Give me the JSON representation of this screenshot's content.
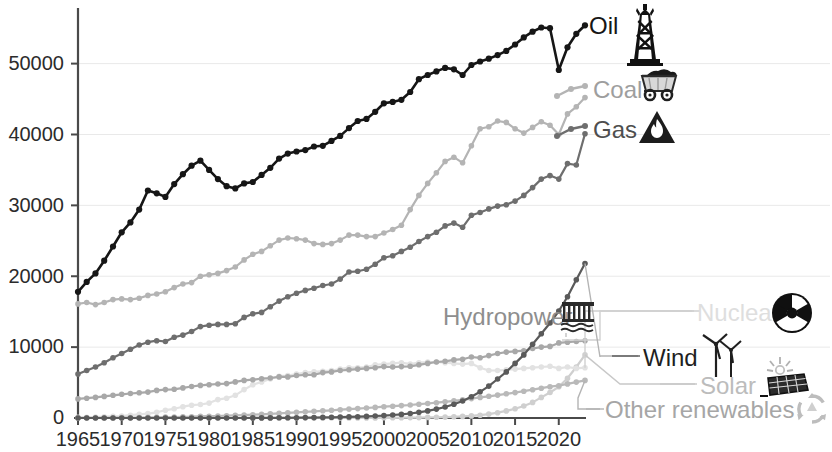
{
  "chart_data": {
    "type": "line",
    "title": "",
    "subtitle": "",
    "xlabel": "",
    "ylabel": "",
    "xlim": [
      1965,
      2023
    ],
    "ylim": [
      0,
      57000
    ],
    "grid": true,
    "legend_position": "inline-right-labels",
    "x_ticks": [
      "1965",
      "1970",
      "1975",
      "1980",
      "1985",
      "1990",
      "1995",
      "2000",
      "2005",
      "2010",
      "2015",
      "2020"
    ],
    "x_tick_values": [
      1965,
      1970,
      1975,
      1980,
      1985,
      1990,
      1995,
      2000,
      2005,
      2010,
      2015,
      2020
    ],
    "y_ticks": [
      "0",
      "10000",
      "20000",
      "30000",
      "40000",
      "50000"
    ],
    "y_tick_values": [
      0,
      10000,
      20000,
      30000,
      40000,
      50000
    ],
    "x": [
      1965,
      1966,
      1967,
      1968,
      1969,
      1970,
      1971,
      1972,
      1973,
      1974,
      1975,
      1976,
      1977,
      1978,
      1979,
      1980,
      1981,
      1982,
      1983,
      1984,
      1985,
      1986,
      1987,
      1988,
      1989,
      1990,
      1991,
      1992,
      1993,
      1994,
      1995,
      1996,
      1997,
      1998,
      1999,
      2000,
      2001,
      2002,
      2003,
      2004,
      2005,
      2006,
      2007,
      2008,
      2009,
      2010,
      2011,
      2012,
      2013,
      2014,
      2015,
      2016,
      2017,
      2018,
      2019,
      2020,
      2021,
      2022,
      2023
    ],
    "series": [
      {
        "name": "Oil",
        "color": "#161616",
        "icon": "oil-derrick-icon",
        "label_color": "#161616",
        "values": [
          17800,
          19200,
          20400,
          22200,
          24200,
          26200,
          27600,
          29400,
          32100,
          31700,
          31200,
          33000,
          34400,
          35600,
          36300,
          35000,
          33700,
          32700,
          32400,
          33100,
          33300,
          34300,
          35300,
          36600,
          37300,
          37600,
          37800,
          38300,
          38400,
          39100,
          39800,
          40900,
          41900,
          42200,
          43200,
          44400,
          44600,
          44900,
          46000,
          47800,
          48400,
          48900,
          49400,
          49200,
          48400,
          49800,
          50300,
          50700,
          51200,
          51800,
          52700,
          53700,
          54500,
          55100,
          55000,
          49100,
          52300,
          54200,
          55400
        ]
      },
      {
        "name": "Coal",
        "color": "#b4b4b4",
        "icon": "coal-cart-icon",
        "label_color": "#9e9e9e",
        "values": [
          16100,
          16300,
          16000,
          16300,
          16700,
          16800,
          16700,
          16900,
          17300,
          17500,
          17800,
          18400,
          18900,
          19100,
          20000,
          20200,
          20400,
          20800,
          21300,
          22300,
          23100,
          23500,
          24300,
          25100,
          25400,
          25300,
          25100,
          24600,
          24500,
          24600,
          25100,
          25800,
          25800,
          25600,
          25600,
          26100,
          26600,
          27200,
          29400,
          31400,
          33100,
          34600,
          36200,
          36800,
          36000,
          38400,
          40800,
          41100,
          41900,
          41700,
          40800,
          40200,
          41000,
          41800,
          41300,
          40000,
          42900,
          43900,
          45200
        ]
      },
      {
        "name": "Gas",
        "color": "#6e6e6e",
        "icon": "gas-flame-icon",
        "label_color": "#4e4e4e",
        "values": [
          6200,
          6700,
          7200,
          7800,
          8500,
          9100,
          9700,
          10300,
          10700,
          10900,
          10800,
          11400,
          11700,
          12200,
          12900,
          13100,
          13200,
          13200,
          13300,
          14200,
          14700,
          14900,
          15700,
          16500,
          17100,
          17600,
          18000,
          18300,
          18700,
          18900,
          19600,
          20600,
          20700,
          21000,
          21700,
          22600,
          22900,
          23500,
          24100,
          24900,
          25600,
          26200,
          27100,
          27500,
          26900,
          28600,
          29000,
          29500,
          29900,
          30100,
          30600,
          31400,
          32500,
          33700,
          34200,
          33700,
          35900,
          35700,
          40100
        ]
      },
      {
        "name": "Hydropower",
        "color": "#a8a8a8",
        "icon": "hydro-dam-icon",
        "label_color": "#8e8e8e",
        "values": [
          2700,
          2800,
          2900,
          3050,
          3200,
          3350,
          3450,
          3550,
          3650,
          3900,
          4000,
          4050,
          4250,
          4450,
          4600,
          4700,
          4800,
          4850,
          5100,
          5300,
          5400,
          5550,
          5650,
          5800,
          5800,
          6000,
          6100,
          6100,
          6400,
          6500,
          6700,
          6800,
          6900,
          7000,
          7100,
          7250,
          7200,
          7250,
          7300,
          7500,
          7700,
          7900,
          8000,
          8200,
          8300,
          8600,
          8500,
          8800,
          9100,
          9300,
          9400,
          9500,
          9800,
          10000,
          10100,
          10600,
          10700,
          10800,
          10900
        ]
      },
      {
        "name": "Nuclear",
        "color": "#e2e2e2",
        "icon": "nuclear-radiation-icon",
        "label_color": "#dcdcdc",
        "values": [
          80,
          100,
          130,
          180,
          230,
          280,
          390,
          510,
          620,
          800,
          1100,
          1300,
          1600,
          1800,
          1900,
          2100,
          2600,
          2800,
          3200,
          4000,
          4700,
          5100,
          5500,
          5900,
          6000,
          6200,
          6400,
          6500,
          6600,
          6700,
          6900,
          7100,
          7100,
          7200,
          7500,
          7600,
          7700,
          7800,
          7600,
          7800,
          7900,
          7900,
          7800,
          7700,
          7600,
          7700,
          7100,
          6700,
          6700,
          6800,
          6900,
          7000,
          7100,
          7200,
          7300,
          7000,
          7200,
          7000,
          7100
        ]
      },
      {
        "name": "Wind",
        "color": "#5a5a5a",
        "icon": "wind-turbine-icon",
        "label_color": "#1f1f1f",
        "values": [
          0,
          0,
          0,
          0,
          0,
          0,
          0,
          0,
          0,
          0,
          0,
          0,
          0,
          0,
          0,
          0,
          0,
          0,
          0,
          0,
          10,
          15,
          20,
          25,
          30,
          40,
          50,
          60,
          80,
          100,
          120,
          150,
          180,
          220,
          280,
          340,
          420,
          510,
          640,
          800,
          1000,
          1250,
          1550,
          1950,
          2400,
          3000,
          3700,
          4500,
          5500,
          6500,
          7700,
          8900,
          10400,
          11900,
          13400,
          15100,
          17100,
          19500,
          21800
        ]
      },
      {
        "name": "Solar",
        "color": "#cfcfcf",
        "icon": "solar-panel-icon",
        "label_color": "#b8b8b8",
        "values": [
          0,
          0,
          0,
          0,
          0,
          0,
          0,
          0,
          0,
          0,
          0,
          0,
          0,
          0,
          0,
          0,
          0,
          0,
          0,
          0,
          0,
          0,
          0,
          0,
          0,
          2,
          3,
          4,
          5,
          7,
          9,
          11,
          14,
          17,
          21,
          26,
          32,
          40,
          50,
          63,
          80,
          100,
          130,
          170,
          220,
          290,
          400,
          550,
          750,
          1000,
          1300,
          1700,
          2200,
          2900,
          3600,
          4400,
          5600,
          7200,
          8900
        ]
      },
      {
        "name": "Other renewables",
        "color": "#b9b9b9",
        "icon": "recycle-leaf-icon",
        "label_color": "#a0a0a0",
        "values": [
          20,
          25,
          30,
          35,
          40,
          50,
          60,
          70,
          85,
          100,
          120,
          140,
          165,
          190,
          220,
          250,
          280,
          320,
          360,
          410,
          460,
          520,
          580,
          650,
          720,
          800,
          870,
          940,
          1010,
          1090,
          1170,
          1250,
          1330,
          1410,
          1500,
          1590,
          1660,
          1750,
          1840,
          1940,
          2040,
          2160,
          2290,
          2430,
          2560,
          2740,
          2900,
          3060,
          3230,
          3410,
          3590,
          3780,
          3990,
          4200,
          4420,
          4560,
          4810,
          5060,
          5300
        ]
      }
    ]
  },
  "axis": {
    "y_labels": [
      "50000",
      "40000",
      "30000",
      "20000",
      "10000",
      "0"
    ],
    "x_labels": [
      "1965",
      "1970",
      "1975",
      "1980",
      "1985",
      "1990",
      "1995",
      "2000",
      "2005",
      "2010",
      "2015",
      "2020"
    ]
  },
  "labels": {
    "oil": "Oil",
    "coal": "Coal",
    "gas": "Gas",
    "hydropower": "Hydropower",
    "nuclear": "Nuclear",
    "wind": "Wind",
    "solar": "Solar",
    "other_renewables": "Other renewables"
  },
  "icons": {
    "oil": "oil-derrick-icon",
    "coal": "coal-cart-icon",
    "gas": "gas-flame-icon",
    "hydropower": "hydro-dam-icon",
    "nuclear": "nuclear-radiation-icon",
    "wind": "wind-turbine-icon",
    "solar": "solar-panel-icon",
    "other_renewables": "recycle-leaf-icon"
  },
  "colors": {
    "oil": "#161616",
    "coal": "#b4b4b4",
    "gas": "#6e6e6e",
    "hydropower": "#a8a8a8",
    "nuclear": "#e2e2e2",
    "wind": "#5a5a5a",
    "solar": "#cfcfcf",
    "other_renewables": "#b9b9b9",
    "axis": "#4a4a4a",
    "grid": "#e9e9e9",
    "background": "#ffffff"
  }
}
